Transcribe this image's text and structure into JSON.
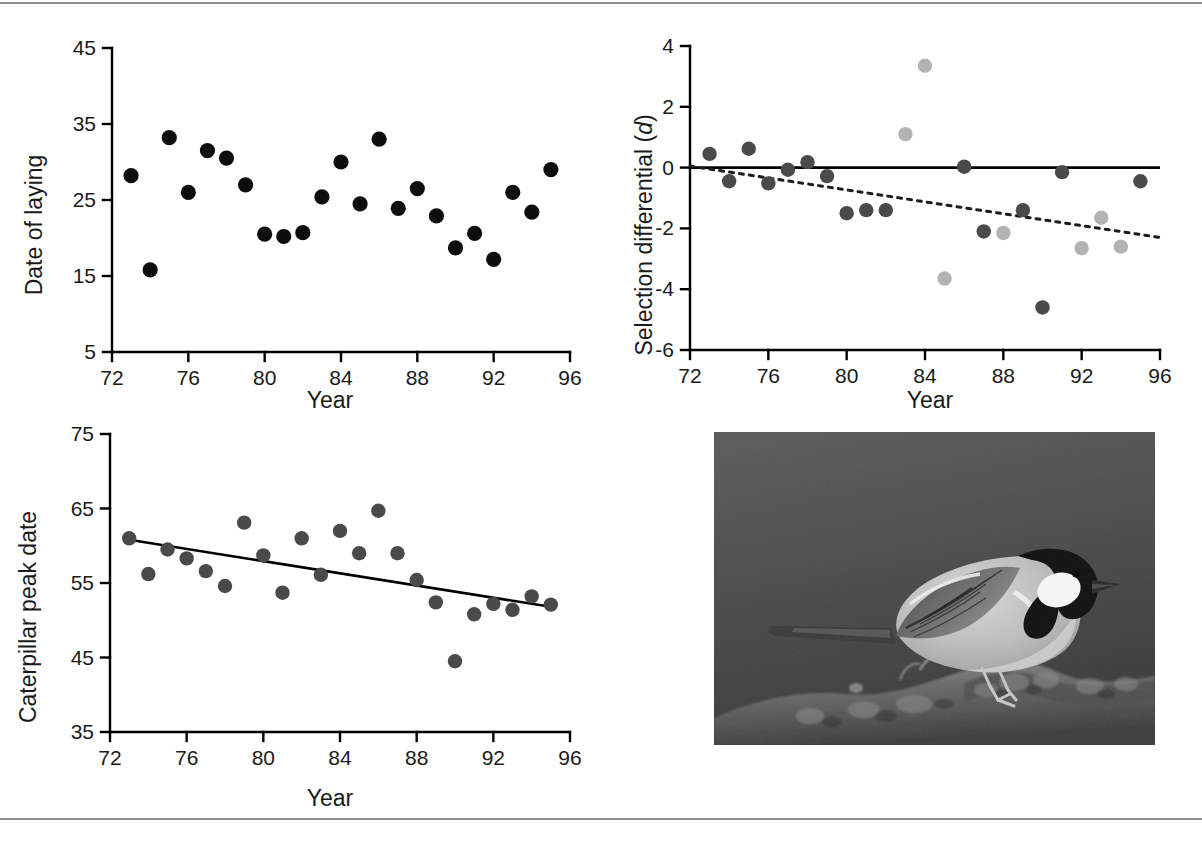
{
  "figure": {
    "title": "",
    "caption": "",
    "background_color": "#ffffff",
    "rule_color": "#8d8d8d"
  },
  "colors": {
    "point_black": "#0d0d0d",
    "point_dark_gray": "#4a4a4a",
    "point_light_gray": "#b3b3b3",
    "axis": "#000000",
    "trend_line": "#000000"
  },
  "panels": {
    "top_left": {
      "name": "date-of-laying-panel"
    },
    "top_right": {
      "name": "selection-differential-panel"
    },
    "bottom_left": {
      "name": "caterpillar-peak-date-panel"
    },
    "bottom_right": {
      "name": "great-tit-photo-panel"
    }
  },
  "photo": {
    "alt": "Great tit bird perched on a mossy branch",
    "subject": "great-tit-bird",
    "rendering": "grayscale-photograph"
  },
  "chart_data": [
    {
      "id": "date-of-laying",
      "type": "scatter",
      "title": "",
      "xlabel": "Year",
      "ylabel": "Date of laying",
      "xlim": [
        72,
        96
      ],
      "ylim": [
        5,
        45
      ],
      "xticks": [
        72,
        76,
        80,
        84,
        88,
        92,
        96
      ],
      "xticklabels": [
        "72",
        "76",
        "80",
        "84",
        "88",
        "92",
        "96"
      ],
      "yticks": [
        5,
        15,
        25,
        35,
        45
      ],
      "yticklabels": [
        "5",
        "15",
        "25",
        "35",
        "45"
      ],
      "grid": false,
      "legend": "none",
      "marker_color": "#0d0d0d",
      "series": [
        {
          "name": "Date of laying",
          "points": [
            [
              73,
              28.2
            ],
            [
              74,
              15.8
            ],
            [
              75,
              33.2
            ],
            [
              77,
              31.5
            ],
            [
              76,
              26.0
            ],
            [
              78,
              30.5
            ],
            [
              79,
              27.0
            ],
            [
              80,
              20.5
            ],
            [
              81,
              20.2
            ],
            [
              82,
              20.7
            ],
            [
              83,
              25.4
            ],
            [
              84,
              30.0
            ],
            [
              85,
              24.5
            ],
            [
              86,
              33.0
            ],
            [
              87,
              23.9
            ],
            [
              88,
              26.5
            ],
            [
              89,
              22.9
            ],
            [
              90,
              18.7
            ],
            [
              91,
              20.6
            ],
            [
              92,
              17.2
            ],
            [
              93,
              26.0
            ],
            [
              94,
              23.4
            ],
            [
              95,
              29.0
            ]
          ]
        }
      ]
    },
    {
      "id": "selection-differential",
      "type": "scatter",
      "title": "",
      "xlabel": "Year",
      "ylabel": "Selection differential (d)",
      "ylabel_plain": "Selection differential (",
      "ylabel_italic": "d",
      "ylabel_tail": ")",
      "xlim": [
        72,
        96
      ],
      "ylim": [
        -6,
        4
      ],
      "xticks": [
        72,
        76,
        80,
        84,
        88,
        92,
        96
      ],
      "xticklabels": [
        "72",
        "76",
        "80",
        "84",
        "88",
        "92",
        "96"
      ],
      "yticks": [
        -6,
        -4,
        -2,
        0,
        2,
        4
      ],
      "yticklabels": [
        "-6",
        "-4",
        "-2",
        "0",
        "2",
        "4"
      ],
      "grid": false,
      "legend": "none",
      "reference_line": {
        "y": 0,
        "style": "solid"
      },
      "trend_line": {
        "style": "dotted",
        "x1": 72,
        "y1": 0.05,
        "x2": 96,
        "y2": -2.3
      },
      "series": [
        {
          "name": "dark points",
          "color": "#4a4a4a",
          "points": [
            [
              73,
              0.45
            ],
            [
              74,
              -0.45
            ],
            [
              75,
              0.62
            ],
            [
              76,
              -0.52
            ],
            [
              77,
              -0.07
            ],
            [
              78,
              0.18
            ],
            [
              79,
              -0.28
            ],
            [
              80,
              -1.5
            ],
            [
              81,
              -1.4
            ],
            [
              82,
              -1.4
            ],
            [
              86,
              0.03
            ],
            [
              87,
              -2.1
            ],
            [
              89,
              -1.4
            ],
            [
              90,
              -4.6
            ],
            [
              91,
              -0.15
            ],
            [
              95,
              -0.45
            ]
          ]
        },
        {
          "name": "light points",
          "color": "#b3b3b3",
          "points": [
            [
              83,
              1.1
            ],
            [
              84,
              3.35
            ],
            [
              85,
              -3.65
            ],
            [
              88,
              -2.15
            ],
            [
              92,
              -2.65
            ],
            [
              93,
              -1.65
            ],
            [
              94,
              -2.6
            ]
          ]
        }
      ]
    },
    {
      "id": "caterpillar-peak-date",
      "type": "scatter",
      "title": "",
      "xlabel": "Year",
      "ylabel": "Caterpillar peak date",
      "xlim": [
        72,
        96
      ],
      "ylim": [
        35,
        75
      ],
      "xticks": [
        72,
        76,
        80,
        84,
        88,
        92,
        96
      ],
      "xticklabels": [
        "72",
        "76",
        "80",
        "84",
        "88",
        "92",
        "96"
      ],
      "yticks": [
        35,
        45,
        55,
        65,
        75
      ],
      "yticklabels": [
        "35",
        "45",
        "55",
        "65",
        "75"
      ],
      "grid": false,
      "legend": "none",
      "marker_color": "#4a4a4a",
      "trend_line": {
        "style": "solid",
        "x1": 73,
        "y1": 60.8,
        "x2": 95,
        "y2": 51.8
      },
      "series": [
        {
          "name": "Caterpillar peak date",
          "points": [
            [
              73,
              61.0
            ],
            [
              74,
              56.2
            ],
            [
              75,
              59.5
            ],
            [
              76,
              58.3
            ],
            [
              77,
              56.6
            ],
            [
              78,
              54.6
            ],
            [
              79,
              63.1
            ],
            [
              80,
              58.7
            ],
            [
              81,
              53.7
            ],
            [
              82,
              61.0
            ],
            [
              83,
              56.1
            ],
            [
              84,
              62.0
            ],
            [
              85,
              59.0
            ],
            [
              86,
              64.7
            ],
            [
              87,
              59.0
            ],
            [
              88,
              55.4
            ],
            [
              89,
              52.4
            ],
            [
              90,
              44.5
            ],
            [
              91,
              50.8
            ],
            [
              92,
              52.2
            ],
            [
              93,
              51.4
            ],
            [
              94,
              53.2
            ],
            [
              95,
              52.1
            ]
          ]
        }
      ]
    }
  ]
}
